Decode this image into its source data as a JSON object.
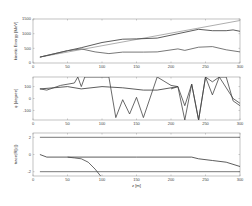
{
  "chart_data": [
    {
      "type": "line",
      "ylabel": "kinetic Energy [MeV]",
      "xlabel": "",
      "xlim": [
        0,
        300
      ],
      "ylim": [
        0,
        1500
      ],
      "xticks": [
        0,
        50,
        100,
        150,
        200,
        250,
        300
      ],
      "yticks": [
        0,
        500,
        1000,
        1500
      ],
      "series": [
        {
          "name": "reference",
          "color": "#999999",
          "x": [
            10,
            300
          ],
          "y": [
            200,
            1450
          ]
        },
        {
          "name": "upper",
          "color": "#333333",
          "x": [
            10,
            50,
            70,
            100,
            130,
            150,
            180,
            210,
            240,
            260,
            280,
            290,
            300
          ],
          "y": [
            200,
            420,
            520,
            700,
            810,
            820,
            850,
            1000,
            1150,
            1100,
            1100,
            1130,
            1080
          ]
        },
        {
          "name": "lower",
          "color": "#555555",
          "x": [
            10,
            50,
            70,
            90,
            110,
            130,
            160,
            180,
            210,
            220,
            240,
            260,
            280,
            300
          ],
          "y": [
            200,
            420,
            480,
            380,
            320,
            370,
            370,
            380,
            480,
            430,
            540,
            560,
            450,
            380
          ]
        }
      ]
    },
    {
      "type": "line",
      "ylabel": "φ [degree]",
      "xlabel": "",
      "xlim": [
        0,
        300
      ],
      "ylim": [
        -180,
        180
      ],
      "xticks": [
        0,
        50,
        100,
        150,
        200,
        250,
        300
      ],
      "yticks": [
        -100,
        0,
        100
      ],
      "series": [
        {
          "name": "smooth",
          "color": "#333333",
          "x": [
            10,
            30,
            50,
            70,
            100,
            130,
            160,
            180,
            200,
            210
          ],
          "y": [
            80,
            90,
            100,
            80,
            100,
            90,
            70,
            70,
            90,
            100
          ]
        },
        {
          "name": "oscillating",
          "color": "#444444",
          "x": [
            10,
            20,
            40,
            60,
            65,
            70,
            75,
            110,
            120,
            130,
            140,
            150,
            160,
            180,
            200,
            210,
            220,
            230,
            240,
            250,
            260,
            270,
            280,
            290,
            300
          ],
          "y": [
            80,
            70,
            110,
            130,
            180,
            100,
            180,
            180,
            -160,
            -10,
            -130,
            10,
            -160,
            180,
            110,
            100,
            -60,
            120,
            -180,
            180,
            30,
            180,
            180,
            -20,
            -60
          ]
        },
        {
          "name": "oscillating2",
          "color": "#444444",
          "x": [
            200,
            210,
            220,
            230,
            240,
            250,
            260,
            270,
            290,
            300
          ],
          "y": [
            80,
            100,
            -180,
            120,
            -180,
            180,
            140,
            180,
            0,
            -40
          ]
        }
      ]
    },
    {
      "type": "line",
      "ylabel": "trace(R[z])",
      "xlabel": "z [m]",
      "xlim": [
        0,
        300
      ],
      "ylim": [
        -2.5,
        2.5
      ],
      "xticks": [
        0,
        50,
        100,
        150,
        200,
        250,
        300
      ],
      "yticks": [
        -2,
        0,
        2
      ],
      "series": [
        {
          "name": "upper bound",
          "color": "#555555",
          "x": [
            10,
            300
          ],
          "y": [
            2,
            2
          ]
        },
        {
          "name": "lower bound",
          "color": "#555555",
          "x": [
            10,
            300
          ],
          "y": [
            -2,
            -2
          ]
        },
        {
          "name": "trace",
          "color": "#333333",
          "x": [
            10,
            20,
            50,
            100,
            150,
            200,
            230,
            240,
            260,
            280,
            300
          ],
          "y": [
            0,
            -0.3,
            -0.3,
            -0.3,
            -0.3,
            -0.3,
            -0.3,
            -0.5,
            -0.7,
            -0.9,
            -1.4
          ]
        },
        {
          "name": "trace divergent",
          "color": "#444444",
          "x": [
            50,
            60,
            70,
            80,
            90,
            98
          ],
          "y": [
            -0.3,
            -0.4,
            -0.5,
            -0.9,
            -1.7,
            -2.5
          ]
        }
      ]
    }
  ]
}
